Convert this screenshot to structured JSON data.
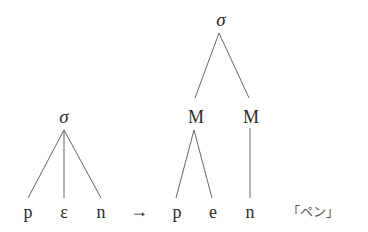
{
  "diagram": {
    "type": "syllable-structure-tree",
    "left_tree": {
      "root": "σ",
      "children": [
        "p",
        "ɛ",
        "n"
      ]
    },
    "arrow": "→",
    "right_tree": {
      "root": "σ",
      "moras": [
        {
          "label": "M",
          "children": [
            "p",
            "e"
          ]
        },
        {
          "label": "M",
          "children": [
            "n"
          ]
        }
      ]
    },
    "gloss": "「ペン」"
  }
}
